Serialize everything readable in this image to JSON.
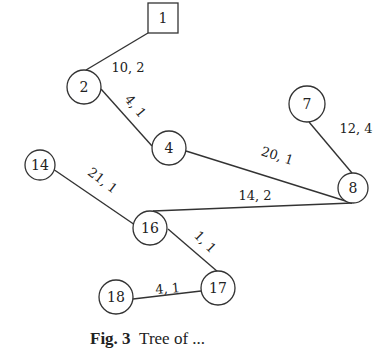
{
  "diagram": {
    "type": "tree",
    "nodes": [
      {
        "id": "1",
        "label": "1",
        "shape": "square",
        "x": 163,
        "y": 18,
        "size": 30
      },
      {
        "id": "2",
        "label": "2",
        "shape": "circle",
        "x": 84,
        "y": 87,
        "r": 17
      },
      {
        "id": "4",
        "label": "4",
        "shape": "circle",
        "x": 169,
        "y": 148,
        "r": 17
      },
      {
        "id": "7",
        "label": "7",
        "shape": "circle",
        "x": 307,
        "y": 104,
        "r": 18
      },
      {
        "id": "8",
        "label": "8",
        "shape": "circle",
        "x": 353,
        "y": 188,
        "r": 15
      },
      {
        "id": "14",
        "label": "14",
        "shape": "circle",
        "x": 40,
        "y": 165,
        "r": 15
      },
      {
        "id": "16",
        "label": "16",
        "shape": "circle",
        "x": 150,
        "y": 228,
        "r": 17
      },
      {
        "id": "17",
        "label": "17",
        "shape": "circle",
        "x": 218,
        "y": 288,
        "r": 17
      },
      {
        "id": "18",
        "label": "18",
        "shape": "circle",
        "x": 116,
        "y": 297,
        "r": 17
      }
    ],
    "edges": [
      {
        "from": "1",
        "to": "2",
        "label": "10, 2",
        "x1": 148,
        "y1": 33,
        "x2": 86,
        "y2": 70,
        "lx": 128,
        "ly": 72,
        "rot": 0
      },
      {
        "from": "2",
        "to": "4",
        "label": "4, 1",
        "x1": 101,
        "y1": 89,
        "x2": 152,
        "y2": 146,
        "lx": 132,
        "ly": 109,
        "rot": 50
      },
      {
        "from": "4",
        "to": "8",
        "label": "20, 1",
        "x1": 186,
        "y1": 151,
        "x2": 352,
        "y2": 203,
        "lx": 276,
        "ly": 160,
        "rot": 18
      },
      {
        "from": "7",
        "to": "8",
        "label": "12, 4",
        "x1": 309,
        "y1": 122,
        "x2": 352,
        "y2": 173,
        "lx": 356,
        "ly": 133,
        "rot": 0
      },
      {
        "from": "8",
        "to": "16",
        "label": "14, 2",
        "x1": 352,
        "y1": 203,
        "x2": 153,
        "y2": 211,
        "lx": 255,
        "ly": 200,
        "rot": 0
      },
      {
        "from": "14",
        "to": "16",
        "label": "21, 1",
        "x1": 53,
        "y1": 169,
        "x2": 135,
        "y2": 225,
        "lx": 100,
        "ly": 184,
        "rot": 37
      },
      {
        "from": "16",
        "to": "17",
        "label": "1, 1",
        "x1": 168,
        "y1": 229,
        "x2": 218,
        "y2": 272,
        "lx": 202,
        "ly": 245,
        "rot": 45
      },
      {
        "from": "17",
        "to": "18",
        "label": "4, 1",
        "x1": 201,
        "y1": 291,
        "x2": 133,
        "y2": 299,
        "lx": 168,
        "ly": 293,
        "rot": -5
      }
    ]
  },
  "caption": {
    "prefix": "Fig. 3",
    "text": "Tree of ..."
  }
}
